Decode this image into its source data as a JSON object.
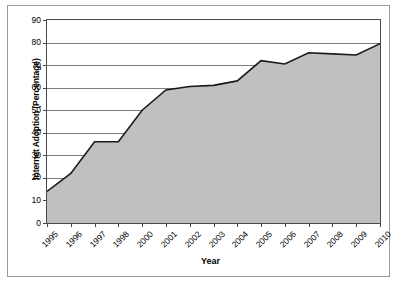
{
  "chart_data": {
    "type": "area",
    "title": "",
    "xlabel": "Year",
    "ylabel": "Internet Adoption (Percentage)",
    "categories": [
      "1995",
      "1996",
      "1997",
      "1998",
      "2000",
      "2001",
      "2002",
      "2003",
      "2004",
      "2005",
      "2006",
      "2007",
      "2008",
      "2009",
      "2010"
    ],
    "values": [
      14,
      22,
      36,
      36,
      50,
      59,
      60.5,
      61,
      63,
      72,
      70.5,
      75.5,
      75,
      74.5,
      79.5
    ],
    "ylim": [
      0,
      90
    ],
    "yticks": [
      "0",
      "10",
      "20",
      "30",
      "40",
      "50",
      "60",
      "70",
      "80",
      "90"
    ],
    "grid": true,
    "legend": "none",
    "colors": {
      "area_fill": "#c0c0c0",
      "line": "#1a1a1a",
      "gridline": "#7d7d7d",
      "axis": "#4a4a4a",
      "text": "#000000",
      "frame": "#9a9a9a"
    }
  }
}
